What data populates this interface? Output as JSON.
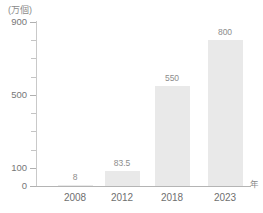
{
  "chart_data": {
    "type": "bar",
    "title": "",
    "subtitle": "",
    "categories": [
      "2008",
      "2012",
      "2018",
      "2023"
    ],
    "values": [
      8,
      83.5,
      550,
      800
    ],
    "value_labels": [
      "8",
      "83.5",
      "550",
      "800"
    ],
    "xlabel": "年",
    "ylabel": "(万個)",
    "ylim": [
      0,
      900
    ],
    "ytick_major": [
      "0",
      "100",
      "500",
      "900"
    ],
    "ytick_all": [
      0,
      100,
      200,
      300,
      400,
      500,
      600,
      700,
      800,
      900
    ],
    "grid": false,
    "legend": "none",
    "bar_color": "#e9e9e9",
    "axis_color": "#b4b4b4",
    "text_color": "#777777"
  },
  "axis": {
    "unit_caption": "(万個)",
    "x_unit": "年",
    "y_labels": [
      {
        "value": 900,
        "text": "900",
        "major": true
      },
      {
        "value": 800,
        "text": "",
        "major": false
      },
      {
        "value": 700,
        "text": "",
        "major": false
      },
      {
        "value": 600,
        "text": "",
        "major": false
      },
      {
        "value": 500,
        "text": "500",
        "major": true
      },
      {
        "value": 400,
        "text": "",
        "major": false
      },
      {
        "value": 300,
        "text": "",
        "major": false
      },
      {
        "value": 200,
        "text": "",
        "major": false
      },
      {
        "value": 100,
        "text": "100",
        "major": true
      },
      {
        "value": 0,
        "text": "0",
        "major": true
      }
    ],
    "x_labels": [
      "2008",
      "2012",
      "2018",
      "2023"
    ]
  },
  "bars": [
    {
      "year": "2008",
      "value": 8,
      "label": "8"
    },
    {
      "year": "2012",
      "value": 83.5,
      "label": "83.5"
    },
    {
      "year": "2018",
      "value": 550,
      "label": "550"
    },
    {
      "year": "2023",
      "value": 800,
      "label": "800"
    }
  ]
}
